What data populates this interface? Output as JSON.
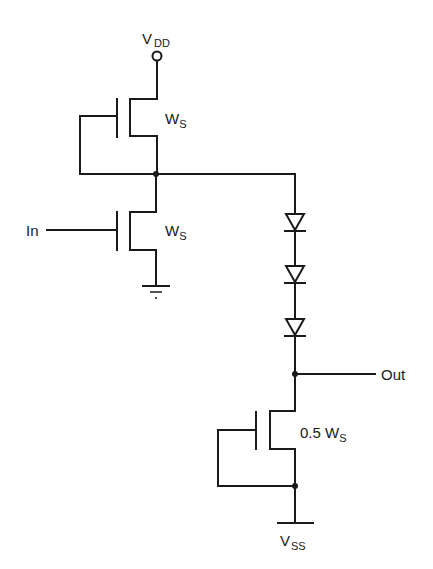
{
  "diagram": {
    "type": "circuit-schematic",
    "labels": {
      "vdd": {
        "main": "V",
        "sub": "DD"
      },
      "vss": {
        "main": "V",
        "sub": "SS"
      },
      "input": "In",
      "output": "Out",
      "top_transistor_width": {
        "main": "W",
        "sub": "S"
      },
      "input_transistor_width": {
        "main": "W",
        "sub": "S"
      },
      "bottom_transistor_width": {
        "prefix": "0.5 W",
        "sub": "S"
      }
    },
    "components": [
      {
        "id": "M1",
        "kind": "nmos-load",
        "gate": "tied-to-source",
        "width": "W_S"
      },
      {
        "id": "M2",
        "kind": "nmos-driver",
        "gate": "In",
        "width": "W_S"
      },
      {
        "id": "D1",
        "kind": "diode"
      },
      {
        "id": "D2",
        "kind": "diode"
      },
      {
        "id": "D3",
        "kind": "diode"
      },
      {
        "id": "M3",
        "kind": "nmos-current-source",
        "gate": "tied-to-source",
        "width": "0.5 W_S"
      }
    ],
    "nodes": [
      "VDD",
      "inverter-output",
      "Out",
      "VSS",
      "GND"
    ],
    "colors": {
      "ink": "#1a1a1a",
      "background": "#ffffff"
    }
  }
}
